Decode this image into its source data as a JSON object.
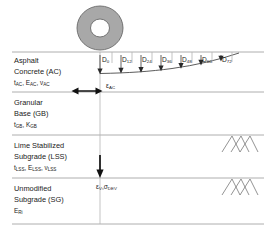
{
  "figure": {
    "colors": {
      "background": "#ffffff",
      "boundary_line": "#9a9a9a",
      "basin_curve": "#4a4a4a",
      "wheel_fill": "#a8a8a8",
      "text": "#1a1a1a",
      "soil_symbol": "#6f6f6f"
    }
  },
  "layers": [
    {
      "name": "asphalt-concrete",
      "line1": "Asphalt",
      "line2": "Concrete (AC)",
      "properties": [
        {
          "symbol": "t",
          "subscript": "AC"
        },
        {
          "symbol": "E",
          "subscript": "AC"
        },
        {
          "symbol": "ν",
          "subscript": "AC"
        }
      ]
    },
    {
      "name": "granular-base",
      "line1": "Granular",
      "line2": "Base (GB)",
      "properties": [
        {
          "symbol": "t",
          "subscript": "GB"
        },
        {
          "symbol": "K",
          "subscript": "GB"
        }
      ]
    },
    {
      "name": "lime-stabilized-subgrade",
      "line1": "Lime Stabilized",
      "line2": "Subgrade (LSS)",
      "properties": [
        {
          "symbol": "t",
          "subscript": "LSS"
        },
        {
          "symbol": "E",
          "subscript": "LSS"
        },
        {
          "symbol": "ν",
          "subscript": "LSS"
        }
      ]
    },
    {
      "name": "unmodified-subgrade",
      "line1": "Unmodified",
      "line2": "Subgrade (SG)",
      "properties": [
        {
          "symbol": "E",
          "subscript": "Ri"
        }
      ]
    }
  ],
  "sensors": [
    {
      "symbol": "D",
      "subscript": "0",
      "x": 103
    },
    {
      "symbol": "D",
      "subscript": "12",
      "x": 124
    },
    {
      "symbol": "D",
      "subscript": "24",
      "x": 144
    },
    {
      "symbol": "D",
      "subscript": "36",
      "x": 164
    },
    {
      "symbol": "D",
      "subscript": "48",
      "x": 184
    },
    {
      "symbol": "D",
      "subscript": "60",
      "x": 204
    },
    {
      "symbol": "D",
      "subscript": "72",
      "x": 224
    }
  ],
  "annotations": {
    "horizontal_strain": {
      "symbol": "ε",
      "subscript": "AC"
    },
    "vertical_stress": {
      "first_symbol": "ε",
      "first_subscript": "V",
      "second_symbol": "σ",
      "second_subscript": "DEV",
      "separator": ","
    }
  },
  "load": {
    "name": "wheel-load-plate"
  }
}
